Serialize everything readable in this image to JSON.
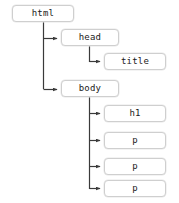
{
  "diagram": {
    "type": "dom-tree",
    "edge_color": "#3a3a3a",
    "node_border_color": "#cfcfcf",
    "node_background": "#ffffff",
    "text_color": "#1a1a1a",
    "canvas": {
      "width": 179,
      "height": 203
    },
    "nodes": [
      {
        "id": "html",
        "label": "html",
        "x": 12,
        "y": 5,
        "w": 62,
        "h": 17,
        "depth": 0
      },
      {
        "id": "head",
        "label": "head",
        "x": 61,
        "y": 29,
        "w": 58,
        "h": 17,
        "depth": 1
      },
      {
        "id": "title",
        "label": "title",
        "x": 104,
        "y": 53,
        "w": 62,
        "h": 17,
        "depth": 2
      },
      {
        "id": "body",
        "label": "body",
        "x": 61,
        "y": 80,
        "w": 58,
        "h": 17,
        "depth": 1
      },
      {
        "id": "h1",
        "label": "h1",
        "x": 104,
        "y": 105,
        "w": 62,
        "h": 17,
        "depth": 2
      },
      {
        "id": "p1",
        "label": "p",
        "x": 104,
        "y": 132,
        "w": 62,
        "h": 17,
        "depth": 2
      },
      {
        "id": "p2",
        "label": "p",
        "x": 104,
        "y": 158,
        "w": 62,
        "h": 17,
        "depth": 2
      },
      {
        "id": "p3",
        "label": "p",
        "x": 104,
        "y": 180,
        "w": 62,
        "h": 17,
        "depth": 2
      }
    ],
    "edges": [
      {
        "from": "html",
        "to": "head",
        "trunk_x": 43,
        "start_y": 22,
        "arrow_y": 38
      },
      {
        "from": "html",
        "to": "body",
        "trunk_x": 43,
        "start_y": 22,
        "arrow_y": 89
      },
      {
        "from": "head",
        "to": "title",
        "trunk_x": 89,
        "start_y": 46,
        "arrow_y": 62
      },
      {
        "from": "body",
        "to": "h1",
        "trunk_x": 89,
        "start_y": 97,
        "arrow_y": 114
      },
      {
        "from": "body",
        "to": "p1",
        "trunk_x": 89,
        "start_y": 97,
        "arrow_y": 141
      },
      {
        "from": "body",
        "to": "p2",
        "trunk_x": 89,
        "start_y": 97,
        "arrow_y": 167
      },
      {
        "from": "body",
        "to": "p3",
        "trunk_x": 89,
        "start_y": 97,
        "arrow_y": 189
      }
    ]
  }
}
